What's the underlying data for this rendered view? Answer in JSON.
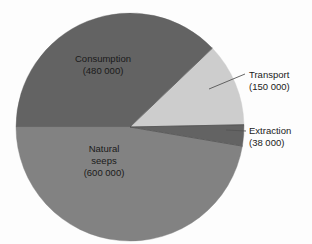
{
  "chart_data": {
    "type": "pie",
    "title": "",
    "subtitle": "",
    "xlabel": "",
    "ylabel": "",
    "legend_position": "none",
    "grid": false,
    "unit_note": "tonnes per year",
    "total": 1268000,
    "categories": [
      "Natural seeps",
      "Consumption",
      "Transport",
      "Extraction"
    ],
    "values": [
      600000,
      480000,
      150000,
      38000
    ],
    "slices": [
      {
        "name": "Consumption",
        "label_line1": "Consumption",
        "label_line2": "(480 000)",
        "value": 480000,
        "value_text": "480 000",
        "percent": 37.9,
        "angle_deg": 136.3,
        "start_deg": 180,
        "end_deg": 316.3,
        "color": "#636363",
        "label_placement": "inside",
        "label_x": 103,
        "label_y": 62
      },
      {
        "name": "Transport",
        "label_line1": "Transport",
        "label_line2": "(150 000)",
        "value": 150000,
        "value_text": "150 000",
        "percent": 11.8,
        "angle_deg": 42.6,
        "start_deg": 316.3,
        "end_deg": 358.9,
        "color": "#cdcdcd",
        "label_placement": "callout",
        "label_x": 249,
        "label_y": 78,
        "leader_from_x": 209,
        "leader_from_y": 89,
        "leader_to_x": 245,
        "leader_to_y": 74
      },
      {
        "name": "Extraction",
        "label_line1": "Extraction",
        "label_line2": "(38 000)",
        "value": 38000,
        "value_text": "38 000",
        "percent": 3.0,
        "angle_deg": 10.8,
        "start_deg": 358.9,
        "end_deg": 9.7,
        "color": "#636363",
        "label_placement": "callout",
        "label_x": 249,
        "label_y": 134,
        "leader_from_x": 226,
        "leader_from_y": 130,
        "leader_to_x": 246,
        "leader_to_y": 131
      },
      {
        "name": "Natural seeps",
        "label_line1": "Natural",
        "label_line2": "seeps",
        "label_line3": "(600 000)",
        "value": 600000,
        "value_text": "600 000",
        "percent": 47.3,
        "angle_deg": 170.4,
        "start_deg": 9.7,
        "end_deg": 180,
        "color": "#828282",
        "label_placement": "inside",
        "label_x": 104,
        "label_y": 152
      }
    ],
    "geometry": {
      "center_x": 130,
      "center_y": 127,
      "radius": 114
    },
    "colors": {
      "background": "#fdfdfd",
      "text": "#1a1a1a",
      "leader": "#555555",
      "dark_gray": "#636363",
      "mid_gray": "#828282",
      "light_gray": "#cdcdcd"
    }
  }
}
